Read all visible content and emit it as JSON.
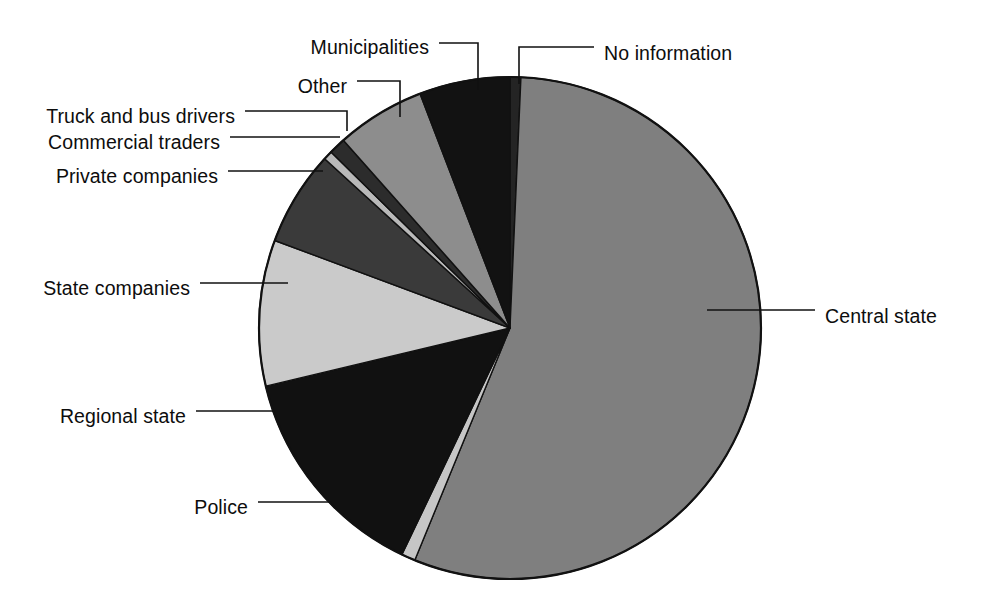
{
  "figure": {
    "background_color": "#ffffff",
    "outline_color": "#111111",
    "text_color": "#0d0d0d"
  },
  "chart_data": {
    "type": "pie",
    "title": "",
    "subtitle": "",
    "xlabel": "",
    "ylabel": "",
    "grid": false,
    "legend": "none (direct leader-line labels)",
    "start_angle_deg": 0,
    "direction": "clockwise",
    "center": {
      "x": 510,
      "y": 328
    },
    "radius": 251,
    "labels": [
      "No information",
      "Central state",
      "Police",
      "Regional state",
      "State companies",
      "Private companies",
      "Commercial traders",
      "Truck and bus drivers",
      "Other",
      "Municipalities"
    ],
    "values": [
      0.7,
      55.5,
      0.9,
      14.2,
      9.4,
      6.1,
      0.6,
      1.1,
      5.7,
      5.8
    ],
    "slices": [
      {
        "name": "No information",
        "value": 0.7,
        "color": "#242424",
        "start_deg": 0.0,
        "end_deg": 2.5,
        "label": "No information",
        "label_x": 604,
        "label_y": 55,
        "leader_points": "519,84 519,47 594,47"
      },
      {
        "name": "Central state",
        "value": 55.5,
        "color": "#7f7f7f",
        "start_deg": 2.5,
        "end_deg": 202.3,
        "label": "Central state",
        "label_x": 825,
        "label_y": 318,
        "leader_points": "707,310 815,310"
      },
      {
        "name": "Police",
        "value": 0.9,
        "color": "#c6c6c6",
        "start_deg": 202.3,
        "end_deg": 205.5,
        "label": "Police",
        "label_x": 186,
        "label_y": 509,
        "leader_points": "332,502 258,502"
      },
      {
        "name": "Regional state",
        "value": 14.2,
        "color": "#111111",
        "start_deg": 205.5,
        "end_deg": 256.6,
        "label": "Regional state",
        "label_x": 47,
        "label_y": 418,
        "leader_points": "274,411 196,411"
      },
      {
        "name": "State companies",
        "value": 9.4,
        "color": "#cacaca",
        "start_deg": 256.6,
        "end_deg": 290.4,
        "label": "State companies",
        "label_x": 31,
        "label_y": 290,
        "leader_points": "288,283 200,283"
      },
      {
        "name": "Private companies",
        "value": 6.1,
        "color": "#3a3a3a",
        "start_deg": 290.4,
        "end_deg": 312.4,
        "label": "Private companies",
        "label_x": 38,
        "label_y": 178,
        "leader_points": "323,171 228,171"
      },
      {
        "name": "Commercial traders",
        "value": 0.6,
        "color": "#b9b9b9",
        "start_deg": 312.4,
        "end_deg": 314.5,
        "label": "Commercial traders",
        "label_x": 31,
        "label_y": 144,
        "leader_points": "340,137 230,137"
      },
      {
        "name": "Truck and bus drivers",
        "value": 1.1,
        "color": "#2c2c2c",
        "start_deg": 314.5,
        "end_deg": 318.4,
        "label": "Truck and bus drivers",
        "label_x": 23,
        "label_y": 118,
        "leader_points": "347,131 347,111 245,111"
      },
      {
        "name": "Other",
        "value": 5.7,
        "color": "#8d8d8d",
        "start_deg": 318.4,
        "end_deg": 339.0,
        "label": "Other",
        "label_x": 299,
        "label_y": 88,
        "leader_points": "400,117 400,81 357,81"
      },
      {
        "name": "Municipalities",
        "value": 5.8,
        "color": "#121212",
        "start_deg": 339.0,
        "end_deg": 360.0,
        "label": "Municipalities",
        "label_x": 281,
        "label_y": 49,
        "leader_points": "478,90 478,43 439,43"
      }
    ]
  }
}
